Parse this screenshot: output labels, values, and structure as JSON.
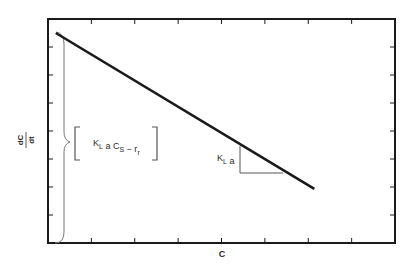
{
  "chart_data": {
    "type": "line",
    "title": "",
    "xlabel": "C",
    "ylabel_numerator": "dC",
    "ylabel_denominator": "dt",
    "xlim": [
      0,
      8
    ],
    "ylim": [
      0,
      8
    ],
    "x_ticks_count": 7,
    "y_ticks_count": 7,
    "tick_labels_shown": false,
    "grid": false,
    "legend": "none",
    "series": [
      {
        "name": "dC/dt vs C",
        "x": [
          0.18,
          6.14
        ],
        "y": [
          7.5,
          1.93
        ]
      }
    ],
    "annotations": {
      "intercept_label": {
        "parts": [
          {
            "text": "K",
            "style": "normal"
          },
          {
            "text": "L",
            "style": "sub"
          },
          {
            "text": " a C",
            "style": "normal"
          },
          {
            "text": "S",
            "style": "sub"
          },
          {
            "text": " − r",
            "style": "normal"
          },
          {
            "text": "r",
            "style": "sub"
          }
        ],
        "meaning": "y-intercept (bracketed, indicated by brace along y-axis)"
      },
      "slope_label": {
        "parts": [
          {
            "text": "K",
            "style": "normal"
          },
          {
            "text": "L",
            "style": "sub"
          },
          {
            "text": " a",
            "style": "normal"
          }
        ],
        "meaning": "negative slope of line (slope triangle)"
      }
    },
    "colors": {
      "line": "#1a1a1a",
      "axis": "#1a1a1a",
      "annotation": "#555555"
    }
  }
}
